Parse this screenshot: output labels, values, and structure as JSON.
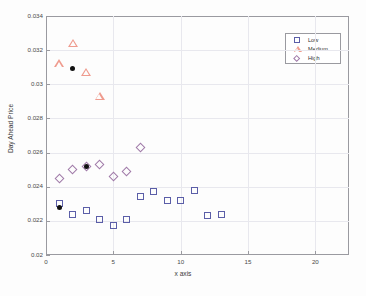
{
  "chart_data": {
    "type": "scatter",
    "title": "",
    "xlabel": "x axis",
    "ylabel": "Day Ahead Price",
    "xlim": [
      0,
      22.5
    ],
    "ylim": [
      0.02,
      0.034
    ],
    "xticks": [
      0,
      5,
      10,
      15,
      20
    ],
    "xtick_labels": [
      "0",
      "5",
      "10",
      "15",
      "20"
    ],
    "yticks": [
      0.02,
      0.022,
      0.024,
      0.026,
      0.028,
      0.03,
      0.032,
      0.034
    ],
    "ytick_labels": [
      "0.02",
      "0.022",
      "0.024",
      "0.026",
      "0.028",
      "0.03",
      "0.032",
      "0.034"
    ],
    "grid": true,
    "legend_position": "top-right",
    "series": [
      {
        "name": "Low",
        "marker": "square",
        "color": "#5b5ea8",
        "x": [
          1,
          2,
          3,
          4,
          5,
          6,
          7,
          8,
          9,
          10,
          11,
          12,
          13
        ],
        "y": [
          0.023,
          0.0224,
          0.0226,
          0.0221,
          0.0217,
          0.0221,
          0.0234,
          0.0237,
          0.0232,
          0.0232,
          0.0238,
          0.0223,
          0.0224
        ]
      },
      {
        "name": "Medium",
        "marker": "triangle",
        "color": "#ef9b8e",
        "x": [
          1,
          2,
          3,
          4
        ],
        "y": [
          0.0312,
          0.0324,
          0.0307,
          0.0293
        ]
      },
      {
        "name": "High",
        "marker": "diamond",
        "color": "#a07aa8",
        "x": [
          1,
          2,
          3,
          4,
          5,
          6,
          7
        ],
        "y": [
          0.0245,
          0.025,
          0.0252,
          0.0253,
          0.0246,
          0.0249,
          0.0263
        ]
      },
      {
        "name": "Highlighted",
        "marker": "filled-circle",
        "color": "#111111",
        "x": [
          1,
          2,
          3
        ],
        "y": [
          0.0228,
          0.0309,
          0.0252
        ]
      }
    ]
  },
  "legend": {
    "items": [
      {
        "label": "Low",
        "marker": "square"
      },
      {
        "label": "Medium",
        "marker": "triangle"
      },
      {
        "label": "High",
        "marker": "diamond"
      }
    ]
  }
}
